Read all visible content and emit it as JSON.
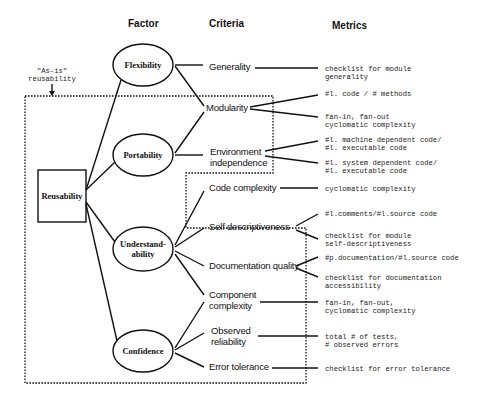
{
  "headers": {
    "factor": "Factor",
    "criteria": "Criteria",
    "metrics": "Metrics"
  },
  "root": {
    "label": "Reusability"
  },
  "annotation": {
    "label": "\"As-is\"\nreusability"
  },
  "factors": [
    {
      "label": "Flexibility"
    },
    {
      "label": "Portability"
    },
    {
      "label": "Understand-\nability"
    },
    {
      "label": "Confidence"
    }
  ],
  "criteria": [
    {
      "label": "Generality"
    },
    {
      "label": "Modularity"
    },
    {
      "label": "Environment\nindependence"
    },
    {
      "label": "Code complexity"
    },
    {
      "label": "Self descriptiveness"
    },
    {
      "label": "Documentation quality"
    },
    {
      "label": "Component\ncomplexity"
    },
    {
      "label": "Observed\nreliability"
    },
    {
      "label": "Error tolerance"
    }
  ],
  "metrics": [
    {
      "label": "checklist for module\ngenerality"
    },
    {
      "label": "#l. code / # methods"
    },
    {
      "label": "fan-in, fan-out\ncyclomatic complexity"
    },
    {
      "label": "#l. machine dependent code/\n#l. executable code"
    },
    {
      "label": "#l. system dependent code/\n#l. executable code"
    },
    {
      "label": "cyclomatic complexity"
    },
    {
      "label": "#l.comments/#l.source code"
    },
    {
      "label": "checklist for module\nself-descriptiveness"
    },
    {
      "label": "#p.documentation/#l.source code"
    },
    {
      "label": "checklist for documentation\naccessibility"
    },
    {
      "label": "fan-in, fan-out,\ncyclomatic complexity"
    },
    {
      "label": "total # of tests,\n# observed errors"
    },
    {
      "label": "checklist for error tolerance"
    }
  ],
  "colors": {
    "ink": "#111111",
    "background": "#ffffff"
  }
}
